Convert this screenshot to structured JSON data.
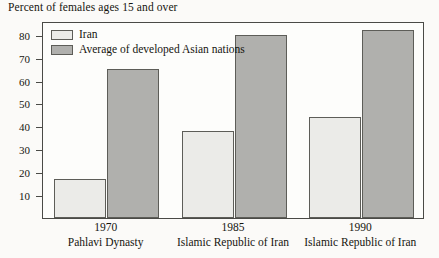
{
  "chart_data": {
    "type": "bar",
    "title": "Percent of females ages 15 and over",
    "xlabel": "",
    "ylabel": "",
    "ylim": [
      0,
      86
    ],
    "yticks": [
      10,
      20,
      30,
      40,
      50,
      60,
      70,
      80
    ],
    "grid": false,
    "legend_position": "top-left",
    "categories": [
      "1970",
      "1985",
      "1990"
    ],
    "category_sublabels": [
      "Pahlavi Dynasty",
      "Islamic Republic of Iran",
      "Islamic Republic of Iran"
    ],
    "series": [
      {
        "name": "Iran",
        "values": [
          17,
          38,
          44
        ],
        "color": "#ebebe8"
      },
      {
        "name": "Average of developed Asian nations",
        "values": [
          65,
          80,
          82
        ],
        "color": "#b0b0ad"
      }
    ]
  },
  "legend": {
    "items": [
      {
        "label": "Iran",
        "swatch": "iran"
      },
      {
        "label": "Average of developed Asian nations",
        "swatch": "asia"
      }
    ]
  },
  "colors": {
    "iran_fill": "#ebebe8",
    "asia_fill": "#b0b0ad",
    "bar_stroke": "#5d5d58",
    "frame": "#4a4a46",
    "page_background": "#fbfaf8",
    "text": "#16150f"
  }
}
